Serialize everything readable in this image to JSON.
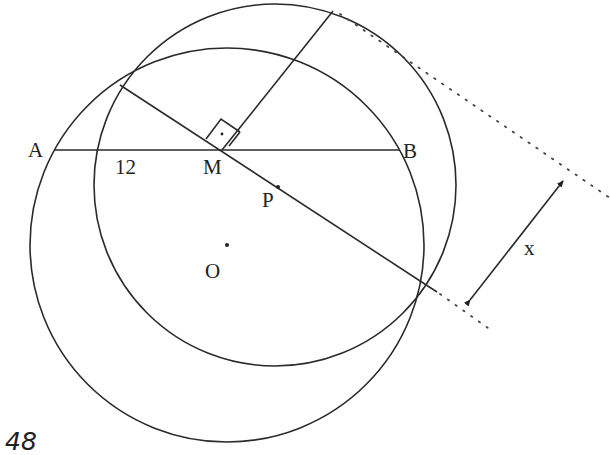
{
  "diagram": {
    "type": "geometry",
    "labels": {
      "A": "A",
      "B": "B",
      "M": "M",
      "P": "P",
      "O": "O",
      "x": "x",
      "segment_AM": "12"
    },
    "page_number": "48",
    "circles": [
      {
        "name": "circle-with-center-O",
        "cx": 227,
        "cy": 245,
        "r": 197
      },
      {
        "name": "second-circle",
        "cx": 275,
        "cy": 185,
        "r": 181
      }
    ],
    "points": {
      "A": [
        55,
        150
      ],
      "B": [
        400,
        150
      ],
      "M": [
        222,
        150
      ],
      "P": [
        278,
        187
      ],
      "O": [
        227,
        245
      ],
      "top_left_intersection": [
        120,
        85
      ],
      "bottom_right_intersection": [
        425,
        285
      ],
      "perpendicular_top": [
        333,
        11
      ]
    },
    "colors": {
      "line": "#2a2a2a",
      "background": "#ffffff"
    }
  }
}
